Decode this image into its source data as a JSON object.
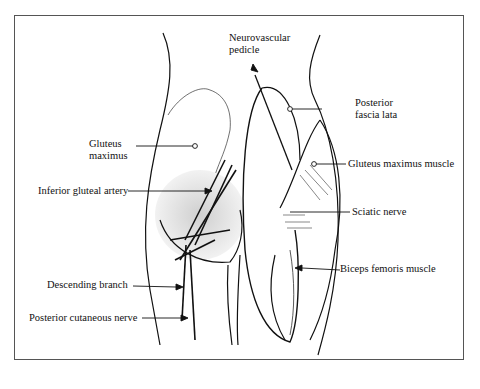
{
  "figure": {
    "labels": {
      "neurovascular_pedicle": [
        "Neurovascular",
        "pedicle"
      ],
      "posterior_fascia_lata": [
        "Posterior",
        "fascia lata"
      ],
      "gluteus_maximus": [
        "Gluteus",
        "maximus"
      ],
      "gluteus_maximus_muscle": "Gluteus maximus muscle",
      "inferior_gluteal_artery": "Inferior gluteal artery",
      "sciatic_nerve": "Sciatic nerve",
      "biceps_femoris_muscle": "Biceps femoris muscle",
      "descending_branch": "Descending branch",
      "posterior_cutaneous_nerve": "Posterior cutaneous nerve"
    },
    "colors": {
      "line": "#111111",
      "shade": "#d8d8d8",
      "border": "#555555",
      "background": "#ffffff"
    }
  }
}
